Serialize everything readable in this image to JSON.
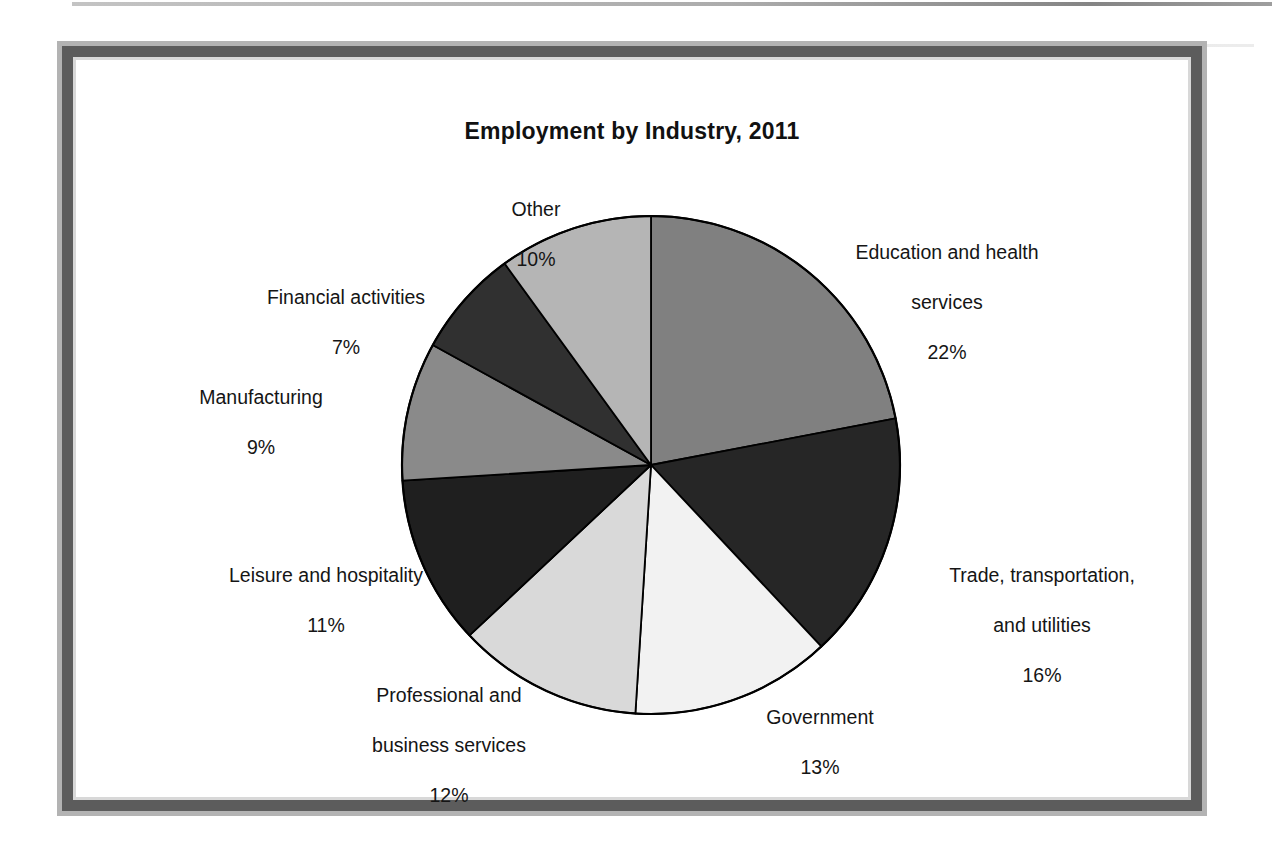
{
  "chart_data": {
    "type": "pie",
    "title": "Employment by Industry, 2011",
    "unit": "%",
    "start_angle_deg": 0,
    "direction": "clockwise",
    "legend": "none (direct slice labels)",
    "categories": [
      "Education and health services",
      "Trade, transportation, and utilities",
      "Government",
      "Professional and business services",
      "Leisure and hospitality",
      "Manufacturing",
      "Financial activities",
      "Other"
    ],
    "values": [
      22,
      16,
      13,
      12,
      11,
      9,
      7,
      10
    ],
    "slices": [
      {
        "label": "Education and health services",
        "label_line1": "Education and health",
        "label_line2": "services",
        "value": 22,
        "pct_text": "22%",
        "color": "#808080"
      },
      {
        "label": "Trade, transportation, and utilities",
        "label_line1": "Trade, transportation,",
        "label_line2": "and utilities",
        "value": 16,
        "pct_text": "16%",
        "color": "#262626"
      },
      {
        "label": "Government",
        "label_line1": "Government",
        "label_line2": "",
        "value": 13,
        "pct_text": "13%",
        "color": "#f2f2f2"
      },
      {
        "label": "Professional and business services",
        "label_line1": "Professional and",
        "label_line2": "business services",
        "value": 12,
        "pct_text": "12%",
        "color": "#d9d9d9"
      },
      {
        "label": "Leisure and hospitality",
        "label_line1": "Leisure and hospitality",
        "label_line2": "",
        "value": 11,
        "pct_text": "11%",
        "color": "#1f1f1f"
      },
      {
        "label": "Manufacturing",
        "label_line1": "Manufacturing",
        "label_line2": "",
        "value": 9,
        "pct_text": "9%",
        "color": "#8a8a8a"
      },
      {
        "label": "Financial activities",
        "label_line1": "Financial activities",
        "label_line2": "",
        "value": 7,
        "pct_text": "7%",
        "color": "#303030"
      },
      {
        "label": "Other",
        "label_line1": "Other",
        "label_line2": "",
        "value": 10,
        "pct_text": "10%",
        "color": "#b5b5b5"
      }
    ],
    "outline_color": "#000000"
  },
  "frame": {
    "outer_border_color": "#b3b3b3",
    "band_color": "#5c5c5c",
    "background": "#ffffff"
  }
}
